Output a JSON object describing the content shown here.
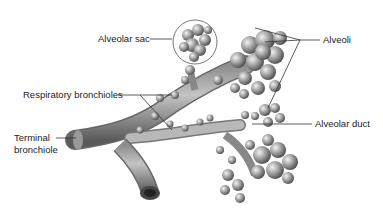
{
  "diagram": {
    "labels": {
      "alveolar_sac": "Alveolar sac",
      "alveoli": "Alveoli",
      "respiratory_bronchioles": "Respiratory bronchioles",
      "alveolar_duct": "Alveolar duct",
      "terminal_bronchiole_line1": "Terminal",
      "terminal_bronchiole_line2": "bronchiole"
    },
    "colors": {
      "tissue_light": "#d8d8d8",
      "tissue_mid": "#9a9a9a",
      "tissue_dark": "#555555",
      "leader_line": "#333333",
      "text": "#222222"
    }
  }
}
